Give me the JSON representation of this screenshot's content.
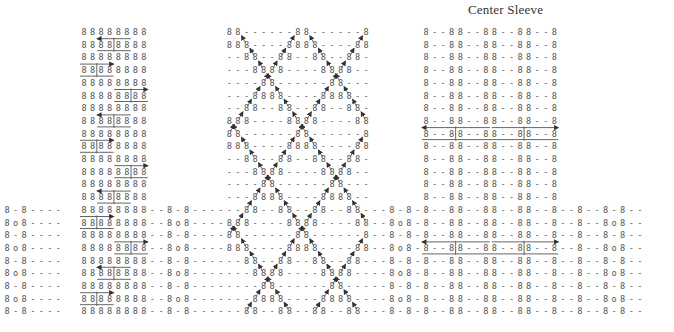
{
  "title": "Center Sleeve",
  "chart_data": {
    "type": "knitting-chart",
    "title": "Center Sleeve",
    "symbols": {
      "8": "knit stitch",
      "-": "purl stitch",
      "o": "bobble / yarn over",
      "arrow-left": "left cable cross",
      "arrow-right": "right cable cross",
      "diagonal": "traveling twisted stitch"
    },
    "grid": {
      "origin_x": 84,
      "origin_y": 32,
      "col_width": 8.55,
      "row_height": 12.7,
      "row_count": 23
    },
    "panels": [
      {
        "name": "left-cable-panel",
        "col_start": 0,
        "cols": 8,
        "pattern": "8 8 8 8 8 8 8 8"
      },
      {
        "name": "diamond-lattice-panel",
        "col_start": 17,
        "cols": 17,
        "pattern_top": "- 8 8 - - 8 8 - - 8 8 8 - -"
      },
      {
        "name": "center-panel",
        "col_start": 40,
        "cols": 18,
        "pattern": "8 - - 8 8 - - 8 8 - - 8 8 - - 8"
      }
    ],
    "full_width_rows_start": 14,
    "full_width_col_start": -9,
    "full_width_col_end": 67
  }
}
